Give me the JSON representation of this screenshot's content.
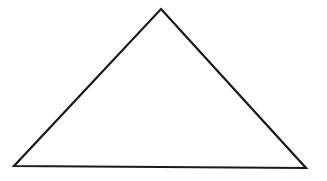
{
  "diagram": {
    "type": "triangle",
    "background": "#ffffff",
    "stroke_color": "#1a1a1a",
    "stroke_width": 2.2,
    "fill": "none",
    "vertices": {
      "apex": {
        "x": 161,
        "y": 9
      },
      "bottom_left": {
        "x": 14,
        "y": 166
      },
      "bottom_right": {
        "x": 306,
        "y": 168
      }
    },
    "labels": []
  }
}
